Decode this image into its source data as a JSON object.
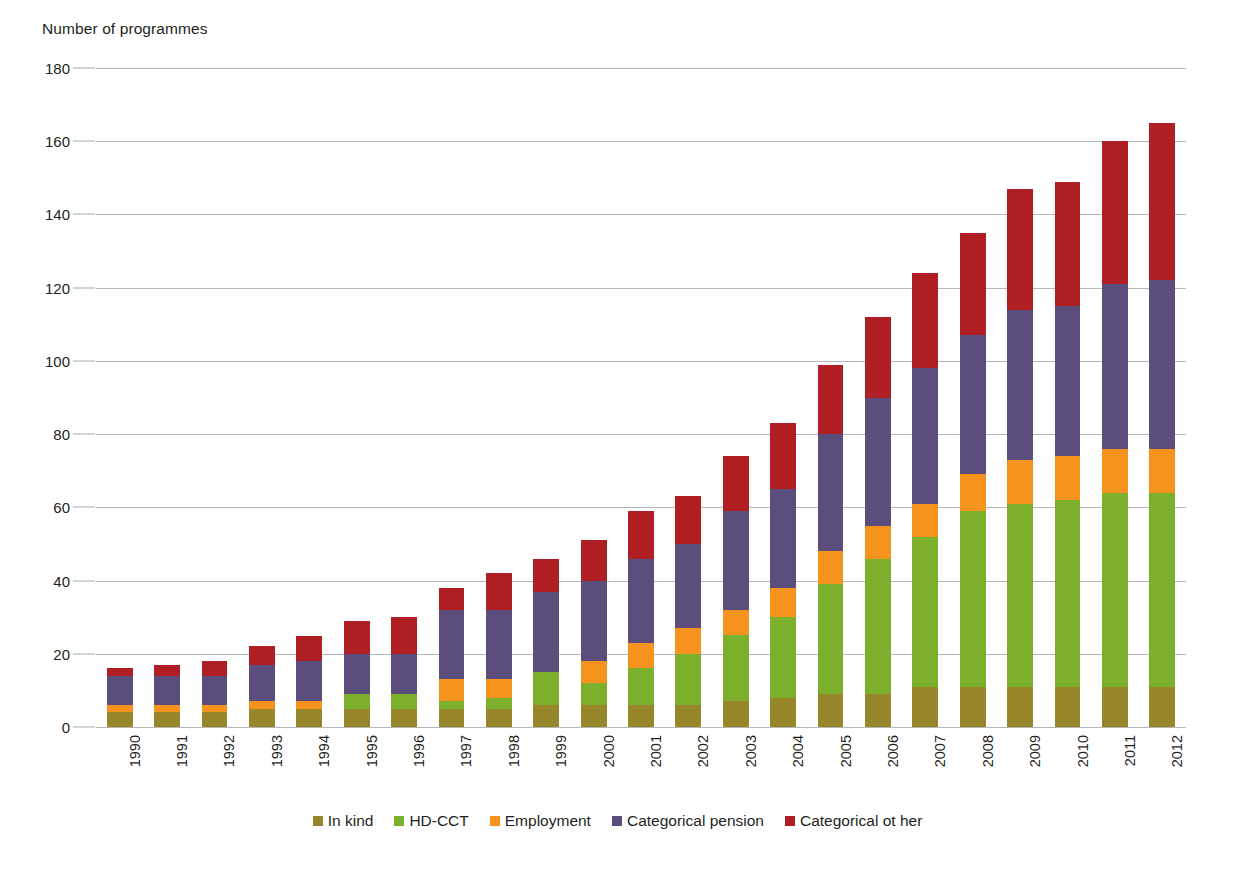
{
  "chart_data": {
    "type": "bar",
    "subtype": "stacked-vertical",
    "title": "",
    "xlabel": "",
    "ylabel": "Number of programmes",
    "ylim": [
      0,
      180
    ],
    "ytick_step": 20,
    "yticks": [
      0,
      20,
      40,
      60,
      80,
      100,
      120,
      140,
      160,
      180
    ],
    "ytick_labels": [
      "0",
      "20",
      "40",
      "60",
      "80",
      "100",
      "120",
      "140",
      "160",
      "180"
    ],
    "grid": true,
    "grid_axis": "y",
    "legend_position": "bottom",
    "categories": [
      "1990",
      "1991",
      "1992",
      "1993",
      "1994",
      "1995",
      "1996",
      "1997",
      "1998",
      "1999",
      "2000",
      "2001",
      "2002",
      "2003",
      "2004",
      "2005",
      "2006",
      "2007",
      "2008",
      "2009",
      "2010",
      "2011",
      "2012"
    ],
    "series": [
      {
        "name": "In kind",
        "color": "#97872a",
        "values": [
          4,
          4,
          4,
          5,
          5,
          5,
          5,
          5,
          5,
          6,
          6,
          6,
          6,
          7,
          8,
          9,
          9,
          11,
          11,
          11,
          11,
          11,
          11
        ]
      },
      {
        "name": "HD-CCT",
        "color": "#7cb02c",
        "values": [
          0,
          0,
          0,
          0,
          0,
          4,
          4,
          2,
          3,
          9,
          6,
          10,
          14,
          18,
          22,
          30,
          37,
          41,
          48,
          50,
          51,
          53,
          53
        ]
      },
      {
        "name": "Employment",
        "color": "#f6921e",
        "values": [
          2,
          2,
          2,
          2,
          2,
          0,
          0,
          6,
          5,
          0,
          6,
          7,
          7,
          7,
          8,
          9,
          9,
          9,
          10,
          12,
          12,
          12,
          12
        ]
      },
      {
        "name": "Categorical pension",
        "color": "#5b4e7c",
        "values": [
          8,
          8,
          8,
          10,
          11,
          11,
          11,
          19,
          19,
          22,
          22,
          23,
          23,
          27,
          27,
          32,
          35,
          37,
          38,
          41,
          41,
          45,
          46
        ]
      },
      {
        "name": "Categorical ot her",
        "color": "#b01f24",
        "values": [
          2,
          3,
          4,
          5,
          7,
          9,
          10,
          6,
          10,
          9,
          11,
          13,
          13,
          15,
          18,
          19,
          22,
          26,
          28,
          33,
          34,
          39,
          43
        ]
      }
    ],
    "totals": [
      16,
      17,
      18,
      22,
      25,
      29,
      30,
      38,
      42,
      46,
      51,
      59,
      63,
      74,
      83,
      99,
      112,
      124,
      135,
      147,
      149,
      160,
      165
    ]
  },
  "legend": {
    "items": [
      {
        "label": "In kind",
        "color": "#97872a"
      },
      {
        "label": "HD-CCT",
        "color": "#7cb02c"
      },
      {
        "label": "Employment",
        "color": "#f6921e"
      },
      {
        "label": "Categorical pension",
        "color": "#5b4e7c"
      },
      {
        "label": "Categorical ot her",
        "color": "#b01f24"
      }
    ]
  },
  "colors": {
    "gridline": "#a7a9ac",
    "text": "#231f20",
    "background": "#ffffff"
  }
}
